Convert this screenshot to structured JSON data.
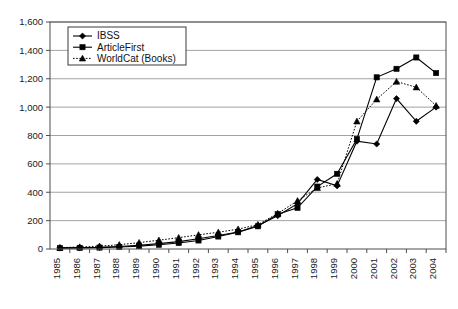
{
  "chart_data": {
    "type": "line",
    "title": "",
    "xlabel": "",
    "ylabel": "",
    "grid": true,
    "legend_position": "top-left-inside",
    "ylim": [
      0,
      1600
    ],
    "ytick_labels": [
      "0",
      "200",
      "400",
      "600",
      "800",
      "1,000",
      "1,200",
      "1,400",
      "1,600"
    ],
    "yticks": [
      0,
      200,
      400,
      600,
      800,
      1000,
      1200,
      1400,
      1600
    ],
    "categories": [
      "1985",
      "1986",
      "1987",
      "1988",
      "1989",
      "1990",
      "1991",
      "1992",
      "1993",
      "1994",
      "1995",
      "1996",
      "1997",
      "1998",
      "1999",
      "2000",
      "2001",
      "2002",
      "2003",
      "2004"
    ],
    "series": [
      {
        "name": "IBSS",
        "marker": "diamond",
        "linestyle": "solid",
        "color": "#000000",
        "values": [
          8,
          10,
          12,
          18,
          26,
          38,
          52,
          72,
          95,
          120,
          165,
          235,
          320,
          490,
          445,
          760,
          740,
          1060,
          900,
          1000
        ]
      },
      {
        "name": "ArticleFirst",
        "marker": "square",
        "linestyle": "solid",
        "color": "#000000",
        "values": [
          6,
          8,
          10,
          14,
          20,
          30,
          42,
          60,
          88,
          118,
          160,
          245,
          290,
          440,
          530,
          775,
          1210,
          1270,
          1350,
          1240
        ]
      },
      {
        "name": "WorldCat (Books)",
        "marker": "triangle",
        "linestyle": "dotted",
        "color": "#000000",
        "values": [
          10,
          14,
          20,
          30,
          45,
          62,
          80,
          100,
          118,
          140,
          172,
          250,
          340,
          430,
          460,
          900,
          1055,
          1180,
          1140,
          1010
        ]
      }
    ]
  },
  "legend": {
    "entries": [
      {
        "label": "IBSS"
      },
      {
        "label": "ArticleFirst"
      },
      {
        "label": "WorldCat (Books)"
      }
    ]
  }
}
